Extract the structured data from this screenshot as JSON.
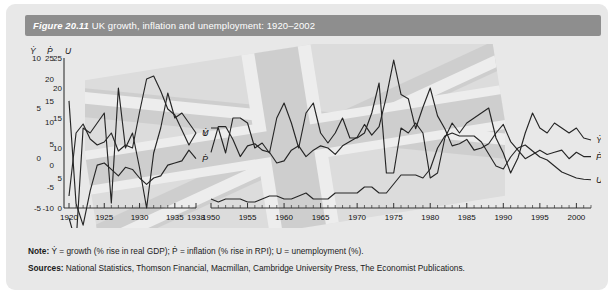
{
  "figure": {
    "label": "Figure 20.11",
    "title": "UK growth, inflation and unemployment: 1920–2002",
    "note_prefix": "Note:",
    "note_text": "Ẏ = growth (% rise in real GDP); Ṗ = inflation (% rise in RPI); U = unemployment (%).",
    "sources_prefix": "Sources:",
    "sources_text": "National Statistics, Thomson Financial, Macmillan, Cambridge University Press, The Economist Publications."
  },
  "colors": {
    "title_bar": "#8e8e8e",
    "panel_bg": "#e8e8e8",
    "line": "#262626",
    "axis": "#333333",
    "title_text": "#ffffff"
  },
  "chart_data": {
    "type": "line",
    "title": "UK growth, inflation and unemployment: 1920–2002",
    "xlabel": "",
    "ylabel": "",
    "grid": false,
    "legend": "inline-right",
    "x_break": {
      "after": 1938,
      "before": 1950
    },
    "xlim": [
      1920,
      2002
    ],
    "xticks": [
      1920,
      1925,
      1930,
      1935,
      1938,
      1950,
      1955,
      1960,
      1965,
      1970,
      1975,
      1980,
      1985,
      1990,
      1995,
      2000
    ],
    "axes": [
      {
        "name": "Ydot",
        "symbol": "Ẏ",
        "ticks": [
          10,
          5,
          0,
          -5
        ],
        "ylim": [
          -5,
          10
        ]
      },
      {
        "name": "Pdot",
        "symbol": "Ṗ",
        "ticks": [
          25,
          20,
          15,
          10,
          5,
          0,
          -5,
          -10
        ],
        "ylim": [
          -10,
          25
        ]
      },
      {
        "name": "U",
        "symbol": "U",
        "ticks": [
          25,
          20,
          15,
          10,
          5,
          0
        ],
        "ylim": [
          0,
          25
        ]
      }
    ],
    "series": [
      {
        "name": "Ẏ",
        "label": "Ẏ",
        "description": "growth (% rise in real GDP)",
        "axis": "Ydot",
        "x": [
          1920,
          1921,
          1922,
          1923,
          1924,
          1925,
          1926,
          1927,
          1928,
          1929,
          1930,
          1931,
          1932,
          1933,
          1934,
          1935,
          1936,
          1937,
          1938,
          1950,
          1951,
          1952,
          1953,
          1954,
          1955,
          1956,
          1957,
          1958,
          1959,
          1960,
          1961,
          1962,
          1963,
          1964,
          1965,
          1966,
          1967,
          1968,
          1969,
          1970,
          1971,
          1972,
          1973,
          1974,
          1975,
          1976,
          1977,
          1978,
          1979,
          1980,
          1981,
          1982,
          1983,
          1984,
          1985,
          1986,
          1987,
          1988,
          1989,
          1990,
          1991,
          1992,
          1993,
          1994,
          1995,
          1996,
          1997,
          1998,
          1999,
          2000,
          2001,
          2002
        ],
        "values": [
          -6.0,
          -8.5,
          3.0,
          2.5,
          3.5,
          4.5,
          -4.5,
          7.0,
          1.0,
          2.5,
          -1.0,
          -5.0,
          0.5,
          3.0,
          6.5,
          4.0,
          4.5,
          3.5,
          2.5,
          3.0,
          3.0,
          0.5,
          4.0,
          4.0,
          3.5,
          1.0,
          1.5,
          0.5,
          4.0,
          5.5,
          3.5,
          1.0,
          4.5,
          5.5,
          2.5,
          1.5,
          2.5,
          4.0,
          2.0,
          2.0,
          2.5,
          4.5,
          7.5,
          -1.5,
          -1.5,
          3.0,
          2.5,
          3.5,
          2.5,
          -2.0,
          -1.5,
          2.0,
          3.5,
          2.5,
          3.5,
          4.0,
          4.5,
          5.0,
          2.0,
          0.5,
          -1.5,
          0.0,
          2.5,
          4.5,
          3.0,
          2.5,
          3.5,
          3.0,
          2.5,
          3.0,
          2.0,
          1.8
        ]
      },
      {
        "name": "Ṗ",
        "label": "Ṗ",
        "description": "inflation (% rise in RPI)",
        "axis": "Pdot",
        "x": [
          1920,
          1921,
          1922,
          1923,
          1924,
          1925,
          1926,
          1927,
          1928,
          1929,
          1930,
          1931,
          1932,
          1933,
          1934,
          1935,
          1936,
          1937,
          1938,
          1950,
          1951,
          1952,
          1953,
          1954,
          1955,
          1956,
          1957,
          1958,
          1959,
          1960,
          1961,
          1962,
          1963,
          1964,
          1965,
          1966,
          1967,
          1968,
          1969,
          1970,
          1971,
          1972,
          1973,
          1974,
          1975,
          1976,
          1977,
          1978,
          1979,
          1980,
          1981,
          1982,
          1983,
          1984,
          1985,
          1986,
          1987,
          1988,
          1989,
          1990,
          1991,
          1992,
          1993,
          1994,
          1995,
          1996,
          1997,
          1998,
          1999,
          2000,
          2001,
          2002
        ],
        "values": [
          15.0,
          -9.0,
          -14.0,
          -6.0,
          0.0,
          0.5,
          -1.0,
          -2.5,
          -0.5,
          -1.0,
          -3.0,
          -4.5,
          -3.0,
          -2.5,
          0.0,
          0.5,
          1.0,
          3.5,
          1.5,
          3.0,
          9.0,
          9.0,
          6.0,
          2.0,
          4.5,
          5.0,
          3.5,
          3.0,
          0.5,
          1.0,
          3.5,
          4.5,
          2.0,
          3.5,
          4.5,
          4.0,
          2.5,
          4.5,
          5.5,
          6.5,
          9.5,
          7.0,
          9.0,
          16.0,
          24.5,
          16.5,
          15.5,
          8.5,
          13.5,
          18.0,
          11.5,
          8.5,
          4.5,
          5.0,
          6.0,
          3.5,
          4.0,
          5.0,
          7.5,
          9.5,
          5.5,
          3.5,
          1.5,
          2.5,
          3.5,
          2.5,
          3.0,
          3.5,
          1.5,
          3.0,
          2.0,
          2.0
        ]
      },
      {
        "name": "U",
        "label": "U",
        "description": "unemployment (%)",
        "axis": "U",
        "x": [
          1920,
          1921,
          1922,
          1923,
          1924,
          1925,
          1926,
          1927,
          1928,
          1929,
          1930,
          1931,
          1932,
          1933,
          1934,
          1935,
          1936,
          1937,
          1938,
          1950,
          1951,
          1952,
          1953,
          1954,
          1955,
          1956,
          1957,
          1958,
          1959,
          1960,
          1961,
          1962,
          1963,
          1964,
          1965,
          1966,
          1967,
          1968,
          1969,
          1970,
          1971,
          1972,
          1973,
          1974,
          1975,
          1976,
          1977,
          1978,
          1979,
          1980,
          1981,
          1982,
          1983,
          1984,
          1985,
          1986,
          1987,
          1988,
          1989,
          1990,
          1991,
          1992,
          1993,
          1994,
          1995,
          1996,
          1997,
          1998,
          1999,
          2000,
          2001,
          2002
        ],
        "values": [
          2.0,
          12.5,
          14.0,
          11.5,
          10.5,
          11.0,
          12.5,
          9.5,
          10.5,
          10.0,
          16.0,
          21.5,
          22.0,
          19.5,
          16.5,
          15.5,
          13.0,
          10.5,
          12.5,
          1.5,
          1.0,
          1.5,
          1.5,
          1.5,
          1.0,
          1.0,
          1.5,
          2.0,
          2.0,
          1.5,
          1.5,
          2.0,
          2.5,
          1.5,
          1.5,
          1.5,
          2.5,
          2.5,
          2.5,
          2.5,
          3.5,
          3.5,
          2.5,
          2.5,
          4.0,
          5.5,
          5.5,
          5.5,
          5.0,
          6.5,
          10.0,
          12.0,
          12.5,
          12.0,
          12.0,
          12.0,
          11.0,
          9.0,
          7.0,
          6.5,
          8.5,
          10.0,
          10.5,
          9.5,
          8.5,
          8.0,
          7.0,
          6.0,
          5.5,
          5.0,
          4.8,
          4.7
        ]
      }
    ],
    "inline_labels": [
      {
        "text": "Ẏ",
        "near_year": 1938
      },
      {
        "text": "U",
        "near_year": 1938
      },
      {
        "text": "Ṗ",
        "near_year": 1938
      }
    ],
    "right_labels": [
      {
        "text": "Ẏ"
      },
      {
        "text": "Ṗ"
      },
      {
        "text": "U"
      }
    ]
  }
}
